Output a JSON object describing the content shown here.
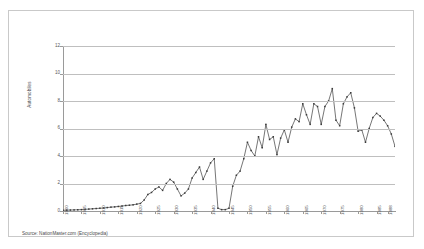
{
  "source_note": "Source: NationMaster.com  (Encyclopedia)",
  "axis": {
    "y_title": "Automobiles",
    "y_ticks": [
      "0",
      "2",
      "4",
      "6",
      "8",
      "10",
      "12"
    ],
    "x_ticks": [
      "1900",
      "1905",
      "1910",
      "1915",
      "1920",
      "1925",
      "1930",
      "1935",
      "1940",
      "1945",
      "1950",
      "1955",
      "1960",
      "1965",
      "1970",
      "1975",
      "1980",
      "1985",
      "1988"
    ]
  },
  "colors": {
    "series": "#3b3b3b",
    "grid": "#bfbfbf",
    "axis": "#9a9a9a",
    "frame": "#c9c9c9",
    "background": "#ffffff",
    "text": "#58585a"
  },
  "chart_data": {
    "type": "line",
    "title": "",
    "xlabel": "",
    "ylabel": "Automobiles",
    "ylim": [
      0,
      12
    ],
    "xlim": [
      1900,
      1990
    ],
    "grid": true,
    "legend": false,
    "markers": true,
    "x": [
      1900,
      1901,
      1902,
      1903,
      1904,
      1905,
      1906,
      1907,
      1908,
      1909,
      1910,
      1911,
      1912,
      1913,
      1914,
      1915,
      1916,
      1917,
      1918,
      1919,
      1920,
      1921,
      1922,
      1923,
      1924,
      1925,
      1926,
      1927,
      1928,
      1929,
      1930,
      1931,
      1932,
      1933,
      1934,
      1935,
      1936,
      1937,
      1938,
      1939,
      1940,
      1941,
      1942,
      1943,
      1944,
      1945,
      1946,
      1947,
      1948,
      1949,
      1950,
      1951,
      1952,
      1953,
      1954,
      1955,
      1956,
      1957,
      1958,
      1959,
      1960,
      1961,
      1962,
      1963,
      1964,
      1965,
      1966,
      1967,
      1968,
      1969,
      1970,
      1971,
      1972,
      1973,
      1974,
      1975,
      1976,
      1977,
      1978,
      1979,
      1980,
      1981,
      1982,
      1983,
      1984,
      1985,
      1986,
      1987,
      1988,
      1989,
      1990
    ],
    "values": [
      0.05,
      0.06,
      0.07,
      0.08,
      0.09,
      0.1,
      0.12,
      0.14,
      0.16,
      0.18,
      0.2,
      0.22,
      0.25,
      0.28,
      0.3,
      0.33,
      0.36,
      0.4,
      0.42,
      0.45,
      0.5,
      0.55,
      0.8,
      1.2,
      1.35,
      1.6,
      1.75,
      1.5,
      2.0,
      2.3,
      2.1,
      1.6,
      1.1,
      1.3,
      1.6,
      2.4,
      2.8,
      3.2,
      2.3,
      2.9,
      3.5,
      3.8,
      0.2,
      0.1,
      0.1,
      0.2,
      1.8,
      2.6,
      2.9,
      3.8,
      5.0,
      4.4,
      4.0,
      5.4,
      4.6,
      6.3,
      5.2,
      5.4,
      4.1,
      5.3,
      5.9,
      5.0,
      6.1,
      6.7,
      6.5,
      7.8,
      7.0,
      6.3,
      7.8,
      7.6,
      6.3,
      7.6,
      8.0,
      8.9,
      6.6,
      6.2,
      7.8,
      8.3,
      8.6,
      7.5,
      5.8,
      5.9,
      5.0,
      6.0,
      6.8,
      7.1,
      6.9,
      6.6,
      6.2,
      5.6,
      4.7
    ]
  }
}
